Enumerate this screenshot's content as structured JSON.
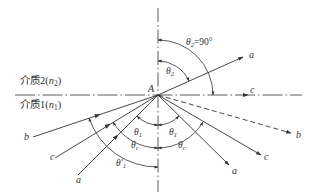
{
  "diagram": {
    "type": "optics-refraction-total-internal-reflection",
    "point_label": "A",
    "media": {
      "upper": {
        "label": "介质2(",
        "n": "n",
        "n_sub": "2",
        "close": ")"
      },
      "lower": {
        "label": "介质1(",
        "n": "n",
        "n_sub": "1",
        "close": ")"
      }
    },
    "rays": {
      "a_incident": "a",
      "a_refracted": "a",
      "a_reflected": "a",
      "b_incident": "b",
      "b_reflected": "b",
      "c_incident": "c",
      "c_refracted": "c",
      "c_reflected": "c"
    },
    "angles": {
      "theta2_90": {
        "sym": "θ",
        "sub": "2",
        "suffix": "=90°"
      },
      "theta2": {
        "sym": "θ",
        "sub": "2"
      },
      "theta1_left": {
        "sym": "θ",
        "sub": "1"
      },
      "theta1_right": {
        "sym": "θ",
        "sub": "1"
      },
      "thetac_left": {
        "sym": "θ",
        "sub": "c"
      },
      "thetac_right": {
        "sym": "θ",
        "sub": "c"
      },
      "theta1_prime": {
        "sym": "θ'",
        "sub": "1"
      }
    },
    "colors": {
      "line": "#333333",
      "background": "#ffffff"
    }
  }
}
